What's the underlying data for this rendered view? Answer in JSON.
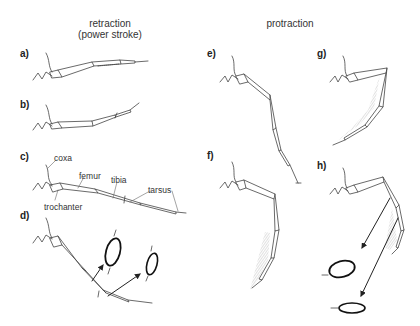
{
  "figure": {
    "headings": {
      "retraction_line1": "retraction",
      "retraction_line2": "(power stroke)",
      "protraction": "protraction"
    },
    "panels": [
      {
        "id": "a",
        "label": "a)",
        "group": "retraction"
      },
      {
        "id": "b",
        "label": "b)",
        "group": "retraction"
      },
      {
        "id": "c",
        "label": "c)",
        "group": "retraction"
      },
      {
        "id": "d",
        "label": "d)",
        "group": "retraction"
      },
      {
        "id": "e",
        "label": "e)",
        "group": "protraction"
      },
      {
        "id": "f",
        "label": "f)",
        "group": "protraction"
      },
      {
        "id": "g",
        "label": "g)",
        "group": "protraction"
      },
      {
        "id": "h",
        "label": "h)",
        "group": "protraction"
      }
    ],
    "segment_labels": {
      "coxa": "coxa",
      "femur": "femur",
      "tibia": "tibia",
      "tarsus": "tarsus",
      "trochanter": "trochanter"
    },
    "colors": {
      "line": "#444444",
      "text": "#333333",
      "hatch": "#9a9a9a",
      "arrow": "#222222"
    }
  }
}
